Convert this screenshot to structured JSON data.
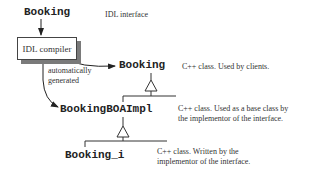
{
  "diagram": {
    "idl_interface": {
      "name": "Booking",
      "label": "IDL interface"
    },
    "compiler": {
      "label": "IDL compiler"
    },
    "generated_label": [
      "automatically",
      "generated"
    ],
    "classes": [
      {
        "name": "Booking",
        "desc": [
          "C++ class.  Used by clients."
        ]
      },
      {
        "name": "BookingBOAImpl",
        "desc": [
          "C++ class. Used as a base class by",
          "the implementor of the interface."
        ]
      },
      {
        "name": "Booking_i",
        "desc": [
          "C++ class.  Written by the",
          "implementor of the interface."
        ]
      }
    ]
  }
}
